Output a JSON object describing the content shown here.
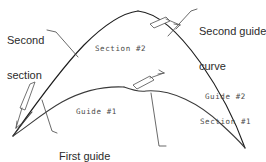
{
  "diagram": {
    "background_color": "#ffffff",
    "stroke_color": "#1d1d1d",
    "label_color": "#2b2b2b",
    "inline_label_color": "#4a4a4a",
    "leader_color": "#4f4f4f",
    "callouts": [
      {
        "id": "second-section",
        "line1": "Second",
        "line2": "section"
      },
      {
        "id": "second-guide-curve",
        "line1": "Second guide",
        "line2": "curve"
      },
      {
        "id": "first-guide-curve",
        "line1": "First guide",
        "line2": "curve"
      },
      {
        "id": "first-section",
        "line1": "First section",
        "line2": ""
      }
    ],
    "inline_labels": [
      {
        "id": "section-2",
        "text": "Section #2"
      },
      {
        "id": "guide-1",
        "text": "Guide #1"
      },
      {
        "id": "guide-2",
        "text": "Guide #2"
      },
      {
        "id": "section-1",
        "text": "Section #1"
      }
    ],
    "markers": [
      {
        "id": "second-guide-arrow",
        "label": "tangent-arrow-upper-right"
      },
      {
        "id": "first-guide-arrow",
        "label": "tangent-arrow-left"
      },
      {
        "id": "first-section-arrow",
        "label": "tangent-arrow-middle"
      }
    ]
  }
}
